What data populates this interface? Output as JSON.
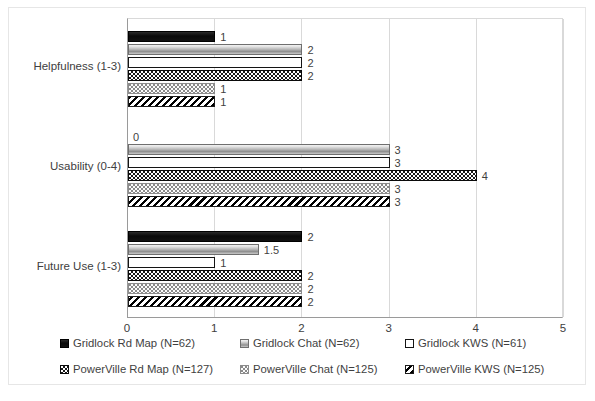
{
  "chart_data": {
    "type": "bar",
    "orientation": "horizontal",
    "title": "",
    "xlabel": "",
    "ylabel": "",
    "xlim": [
      0,
      5
    ],
    "xticks": [
      "0",
      "1",
      "2",
      "3",
      "4",
      "5"
    ],
    "grid": true,
    "legend_position": "bottom",
    "categories": [
      "Helpfulness (1-3)",
      "Usability (0-4)",
      "Future Use (1-3)"
    ],
    "series": [
      {
        "name": "Gridlock Rd Map (N=62)",
        "pattern": "solid-black",
        "values": [
          1,
          0,
          2
        ],
        "labels": [
          "1",
          "0",
          "2"
        ]
      },
      {
        "name": "Gridlock Chat (N=62)",
        "pattern": "gray-gradient",
        "values": [
          2,
          3,
          1.5
        ],
        "labels": [
          "2",
          "3",
          "1.5"
        ]
      },
      {
        "name": "Gridlock KWS (N=61)",
        "pattern": "white-outline",
        "values": [
          2,
          3,
          1
        ],
        "labels": [
          "2",
          "3",
          "1"
        ]
      },
      {
        "name": "PowerVille Rd Map (N=127)",
        "pattern": "black-dots",
        "values": [
          2,
          4,
          2
        ],
        "labels": [
          "2",
          "4",
          "2"
        ]
      },
      {
        "name": "PowerVille Chat (N=125)",
        "pattern": "light-dots",
        "values": [
          1,
          3,
          2
        ],
        "labels": [
          "1",
          "3",
          "2"
        ]
      },
      {
        "name": "PowerVille KWS (N=125)",
        "pattern": "diagonal-stripe",
        "values": [
          1,
          3,
          2
        ],
        "labels": [
          "1",
          "3",
          "2"
        ]
      }
    ]
  },
  "axis": {
    "x_ticks": [
      "0",
      "1",
      "2",
      "3",
      "4",
      "5"
    ],
    "y_categories": [
      "Helpfulness (1-3)",
      "Usability (0-4)",
      "Future Use (1-3)"
    ]
  },
  "legend": {
    "items": [
      {
        "label": "Gridlock Rd Map (N=62)",
        "pattern": "solid-black"
      },
      {
        "label": "Gridlock Chat (N=62)",
        "pattern": "gray-gradient"
      },
      {
        "label": "Gridlock KWS (N=61)",
        "pattern": "white-outline"
      },
      {
        "label": "PowerVille Rd Map (N=127)",
        "pattern": "black-dots"
      },
      {
        "label": "PowerVille Chat (N=125)",
        "pattern": "light-dots"
      },
      {
        "label": "PowerVille KWS (N=125)",
        "pattern": "diagonal-stripe"
      }
    ]
  }
}
